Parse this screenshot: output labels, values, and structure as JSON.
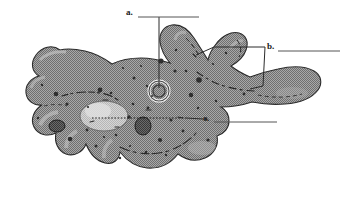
{
  "figure": {
    "type": "labeled-biology-diagram",
    "background_color": "#ffffff",
    "body_fill_color": "#9a9a9a",
    "body_outline_color": "#2b2b2b",
    "organelle_light_color": "#c9c9c9",
    "organelle_dark_color": "#4a4a4a",
    "leader_line_color": "#2b2b2b",
    "answer_line_color": "#555555"
  },
  "labels": [
    {
      "id": "a",
      "text": "a.",
      "blank_line": true,
      "points_to": "contractile-vacuole",
      "leader_style": "solid-vertical"
    },
    {
      "id": "b",
      "text": "b.",
      "blank_line": true,
      "points_to": "pseudopods",
      "leader_style": "solid-bracket-two-lines"
    },
    {
      "id": "c",
      "text": "c.",
      "blank_line": true,
      "points_to": "cytoplasm-nucleus",
      "leader_style": "dotted-horizontal"
    }
  ],
  "structures": [
    {
      "name": "contractile-vacuole",
      "shape": "ring"
    },
    {
      "name": "nucleus",
      "shape": "large-light-oval"
    },
    {
      "name": "food-vacuole",
      "shape": "dark-oval"
    },
    {
      "name": "pseudopod-upper",
      "shape": "finger-projection"
    },
    {
      "name": "pseudopod-lower",
      "shape": "finger-projection"
    },
    {
      "name": "cytoplasm",
      "shape": "granular-body"
    }
  ]
}
